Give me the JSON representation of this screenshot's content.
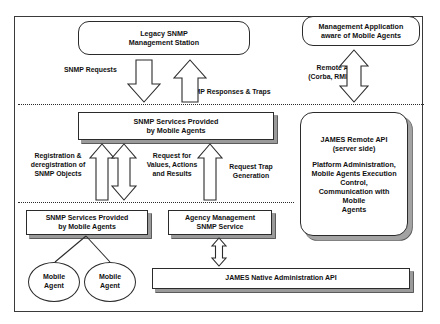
{
  "diagram": {
    "nodes": {
      "legacy_snmp_station": "Legacy SNMP\nManagement Station",
      "management_application": "Management Application\naware of Mobile Agents",
      "snmp_services_top": "SNMP Services Provided\nby Mobile Agents",
      "snmp_services_bottom": "SNMP Services Provided\nby Mobile Agents",
      "agency_management": "Agency Management\nSNMP Service",
      "james_native_api": "JAMES Native Administration API",
      "mobile_agent_1": "Mobile\nAgent",
      "mobile_agent_2": "Mobile\nAgent"
    },
    "james_panel": {
      "title": "JAMES Remote API",
      "subtitle": "(server side)",
      "body": "Platform Administration,\nMobile Agents Execution\nControl,\nCommunication with Mobile\nAgents"
    },
    "edge_labels": {
      "snmp_requests": "SNMP Requests",
      "snmp_responses_traps": "SNMP Responses & Traps",
      "remote_api": "Remote API\n(Corba, RMI...)",
      "registration": "Registration &\nderegistration of\nSNMP Objects",
      "request_values": "Request for\nValues, Actions\nand Results",
      "request_trap": "Request Trap\nGeneration"
    },
    "colors": {
      "stroke": "#2b2b2b",
      "frame": "#3a3a3a",
      "shadow_light": "#9a9a9a",
      "shadow_dark": "#4a4a4a",
      "background": "#ffffff",
      "text": "#111111"
    },
    "layers": {
      "divider_1_label": "",
      "divider_2_label": ""
    }
  }
}
